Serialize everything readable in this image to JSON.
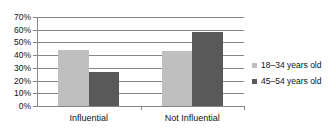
{
  "chart_data": {
    "type": "bar",
    "title": "",
    "subtitle": "",
    "xlabel": "",
    "ylabel": "",
    "categories": [
      "Influential",
      "Not Influential"
    ],
    "series": [
      {
        "name": "18–34 years old",
        "color": "#bfbfbf",
        "values": [
          44,
          43
        ]
      },
      {
        "name": "45–54 years old",
        "color": "#595959",
        "values": [
          27,
          58
        ]
      }
    ],
    "ylim": [
      0,
      70
    ],
    "ytick_labels": [
      "70%",
      "60%",
      "50%",
      "40%",
      "30%",
      "20%",
      "10%",
      "0%"
    ],
    "ytick_values": [
      70,
      60,
      50,
      40,
      30,
      20,
      10,
      0
    ],
    "value_format": "percent",
    "grid": "horizontal",
    "legend_position": "right",
    "axis_color": "#868686",
    "background": "#ffffff"
  },
  "legend": {
    "items": [
      {
        "label": "18–34 years old"
      },
      {
        "label": "45–54 years old"
      }
    ]
  }
}
